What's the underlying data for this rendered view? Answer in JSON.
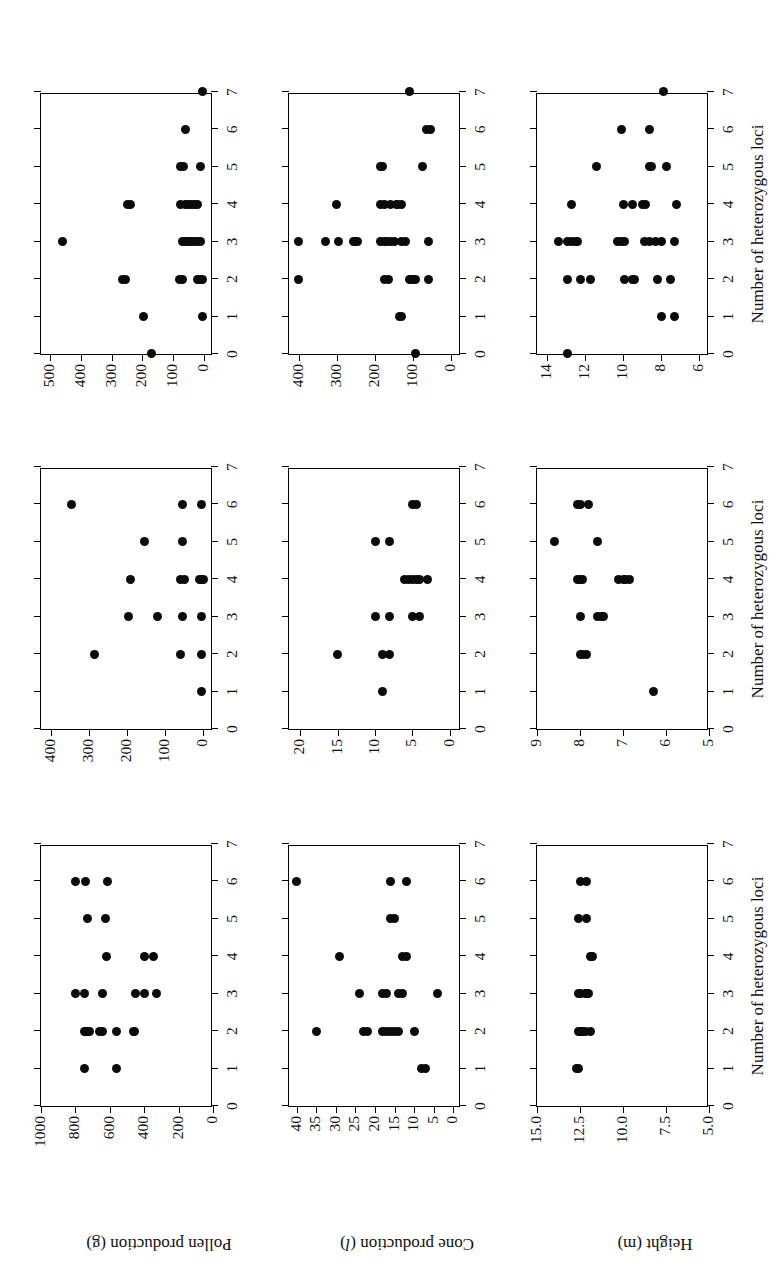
{
  "figure": {
    "x_axis_title": "Number of heterozygous loci",
    "x_ticks": [
      "0",
      "1",
      "2",
      "3",
      "4",
      "5",
      "6",
      "7"
    ],
    "dot_color": "#0b0b0b",
    "axis_color": "#000000"
  },
  "rows": [
    {
      "id": "pollen-production",
      "label": "Pollen production (g)",
      "label_main": "Pollen production (g)",
      "panels": [
        {
          "id": "pollen-panel-1",
          "y_ticks": [
            "0",
            "200",
            "400",
            "600",
            "800",
            "1000"
          ],
          "ylim": [
            0,
            1000
          ]
        },
        {
          "id": "pollen-panel-2",
          "y_ticks": [
            "0",
            "100",
            "200",
            "300",
            "400"
          ],
          "ylim": [
            -25,
            425
          ]
        },
        {
          "id": "pollen-panel-3",
          "y_ticks": [
            "0",
            "100",
            "200",
            "300",
            "400",
            "500"
          ],
          "ylim": [
            -30,
            530
          ]
        }
      ]
    },
    {
      "id": "cone-production",
      "label": "Cone production (l)",
      "label_main": "Cone production (",
      "label_italic": "l",
      "label_tail": ")",
      "panels": [
        {
          "id": "cone-panel-1",
          "y_ticks": [
            "0",
            "5",
            "10",
            "15",
            "20",
            "25",
            "30",
            "35",
            "40"
          ],
          "ylim": [
            -2,
            42
          ]
        },
        {
          "id": "cone-panel-2",
          "y_ticks": [
            "0",
            "5",
            "10",
            "15",
            "20"
          ],
          "ylim": [
            -1.5,
            21.5
          ]
        },
        {
          "id": "cone-panel-3",
          "y_ticks": [
            "0",
            "100",
            "200",
            "300",
            "400"
          ],
          "ylim": [
            -25,
            425
          ]
        }
      ]
    },
    {
      "id": "height",
      "label": "Height (m)",
      "label_main": "Height (m)",
      "panels": [
        {
          "id": "height-panel-1",
          "y_ticks": [
            "5.0",
            "7.5",
            "10.0",
            "12.5",
            "15.0"
          ],
          "ylim": [
            5.0,
            15.0
          ]
        },
        {
          "id": "height-panel-2",
          "y_ticks": [
            "5",
            "6",
            "7",
            "8",
            "9"
          ],
          "ylim": [
            5.0,
            9.0
          ]
        },
        {
          "id": "height-panel-3",
          "y_ticks": [
            "6",
            "8",
            "10",
            "12",
            "14"
          ],
          "ylim": [
            5.5,
            14.5
          ]
        }
      ]
    }
  ],
  "chart_data": [
    {
      "type": "scatter",
      "panel": "pollen-panel-1",
      "title": "",
      "xlabel": "Number of heterozygous loci",
      "ylabel": "Pollen production (g)",
      "xlim": [
        0,
        7
      ],
      "ylim": [
        0,
        1000
      ],
      "xticks": [
        0,
        1,
        2,
        3,
        4,
        5,
        6,
        7
      ],
      "yticks": [
        0,
        200,
        400,
        600,
        800,
        1000
      ],
      "grid": false,
      "points": [
        [
          1,
          745
        ],
        [
          1,
          560
        ],
        [
          2,
          745
        ],
        [
          2,
          740
        ],
        [
          2,
          735
        ],
        [
          2,
          730
        ],
        [
          2,
          720
        ],
        [
          2,
          660
        ],
        [
          2,
          640
        ],
        [
          2,
          560
        ],
        [
          2,
          460
        ],
        [
          2,
          455
        ],
        [
          3,
          800
        ],
        [
          3,
          745
        ],
        [
          3,
          640
        ],
        [
          3,
          450
        ],
        [
          3,
          400
        ],
        [
          3,
          330
        ],
        [
          4,
          620
        ],
        [
          4,
          400
        ],
        [
          4,
          345
        ],
        [
          5,
          730
        ],
        [
          5,
          625
        ],
        [
          6,
          800
        ],
        [
          6,
          740
        ],
        [
          6,
          615
        ]
      ]
    },
    {
      "type": "scatter",
      "panel": "pollen-panel-2",
      "title": "",
      "xlabel": "Number of heterozygous loci",
      "ylabel": "Pollen production (g)",
      "xlim": [
        0,
        7
      ],
      "ylim": [
        -25,
        425
      ],
      "xticks": [
        0,
        1,
        2,
        3,
        4,
        5,
        6,
        7
      ],
      "yticks": [
        0,
        100,
        200,
        300,
        400
      ],
      "grid": false,
      "points": [
        [
          1,
          5
        ],
        [
          2,
          285
        ],
        [
          2,
          60
        ],
        [
          2,
          5
        ],
        [
          3,
          195
        ],
        [
          3,
          120
        ],
        [
          3,
          55
        ],
        [
          3,
          5
        ],
        [
          4,
          190
        ],
        [
          4,
          60
        ],
        [
          4,
          50
        ],
        [
          4,
          10
        ],
        [
          4,
          5
        ],
        [
          4,
          0
        ],
        [
          5,
          155
        ],
        [
          5,
          55
        ],
        [
          6,
          345
        ],
        [
          6,
          55
        ],
        [
          6,
          5
        ]
      ]
    },
    {
      "type": "scatter",
      "panel": "pollen-panel-3",
      "title": "",
      "xlabel": "Number of heterozygous loci",
      "ylabel": "Pollen production (g)",
      "xlim": [
        0,
        7
      ],
      "ylim": [
        -30,
        530
      ],
      "xticks": [
        0,
        1,
        2,
        3,
        4,
        5,
        6,
        7
      ],
      "yticks": [
        0,
        100,
        200,
        300,
        400,
        500
      ],
      "grid": false,
      "points": [
        [
          0,
          170
        ],
        [
          1,
          195
        ],
        [
          1,
          5
        ],
        [
          2,
          265
        ],
        [
          2,
          255
        ],
        [
          2,
          80
        ],
        [
          2,
          70
        ],
        [
          2,
          20
        ],
        [
          2,
          10
        ],
        [
          2,
          5
        ],
        [
          3,
          460
        ],
        [
          3,
          70
        ],
        [
          3,
          60
        ],
        [
          3,
          50
        ],
        [
          3,
          45
        ],
        [
          3,
          40
        ],
        [
          3,
          30
        ],
        [
          3,
          20
        ],
        [
          3,
          10
        ],
        [
          4,
          250
        ],
        [
          4,
          240
        ],
        [
          4,
          75
        ],
        [
          4,
          60
        ],
        [
          4,
          50
        ],
        [
          4,
          40
        ],
        [
          4,
          30
        ],
        [
          4,
          20
        ],
        [
          5,
          75
        ],
        [
          5,
          65
        ],
        [
          5,
          10
        ],
        [
          6,
          60
        ],
        [
          7,
          5
        ]
      ]
    },
    {
      "type": "scatter",
      "panel": "cone-panel-1",
      "title": "",
      "xlabel": "Number of heterozygous loci",
      "ylabel": "Cone production (l)",
      "xlim": [
        0,
        7
      ],
      "ylim": [
        -2,
        42
      ],
      "xticks": [
        0,
        1,
        2,
        3,
        4,
        5,
        6,
        7
      ],
      "yticks": [
        0,
        5,
        10,
        15,
        20,
        25,
        30,
        35,
        40
      ],
      "grid": false,
      "points": [
        [
          1,
          8
        ],
        [
          1,
          7
        ],
        [
          2,
          35
        ],
        [
          2,
          23
        ],
        [
          2,
          22
        ],
        [
          2,
          18
        ],
        [
          2,
          17
        ],
        [
          2,
          16
        ],
        [
          2,
          15
        ],
        [
          2,
          14
        ],
        [
          2,
          10
        ],
        [
          3,
          24
        ],
        [
          3,
          18
        ],
        [
          3,
          17
        ],
        [
          3,
          14
        ],
        [
          3,
          13
        ],
        [
          3,
          4
        ],
        [
          4,
          29
        ],
        [
          4,
          13
        ],
        [
          4,
          12
        ],
        [
          5,
          16
        ],
        [
          5,
          15
        ],
        [
          6,
          40
        ],
        [
          6,
          16
        ],
        [
          6,
          12
        ]
      ]
    },
    {
      "type": "scatter",
      "panel": "cone-panel-2",
      "title": "",
      "xlabel": "Number of heterozygous loci",
      "ylabel": "Cone production (l)",
      "xlim": [
        0,
        7
      ],
      "ylim": [
        -1.5,
        21.5
      ],
      "xticks": [
        0,
        1,
        2,
        3,
        4,
        5,
        6,
        7
      ],
      "yticks": [
        0,
        5,
        10,
        15,
        20
      ],
      "grid": false,
      "points": [
        [
          1,
          9
        ],
        [
          2,
          15
        ],
        [
          2,
          9
        ],
        [
          2,
          8
        ],
        [
          3,
          10
        ],
        [
          3,
          8
        ],
        [
          3,
          5
        ],
        [
          3,
          4
        ],
        [
          4,
          6
        ],
        [
          4,
          5.5
        ],
        [
          4,
          5
        ],
        [
          4,
          4.5
        ],
        [
          4,
          4
        ],
        [
          4,
          3
        ],
        [
          5,
          10
        ],
        [
          5,
          8
        ],
        [
          6,
          5
        ],
        [
          6,
          4.5
        ]
      ]
    },
    {
      "type": "scatter",
      "panel": "cone-panel-3",
      "title": "",
      "xlabel": "Number of heterozygous loci",
      "ylabel": "Cone production (l)",
      "xlim": [
        0,
        7
      ],
      "ylim": [
        -25,
        425
      ],
      "xticks": [
        0,
        1,
        2,
        3,
        4,
        5,
        6,
        7
      ],
      "yticks": [
        0,
        100,
        200,
        300,
        400
      ],
      "grid": false,
      "points": [
        [
          0,
          95
        ],
        [
          1,
          135
        ],
        [
          1,
          130
        ],
        [
          2,
          400
        ],
        [
          2,
          175
        ],
        [
          2,
          165
        ],
        [
          2,
          110
        ],
        [
          2,
          105
        ],
        [
          2,
          100
        ],
        [
          2,
          95
        ],
        [
          2,
          60
        ],
        [
          3,
          400
        ],
        [
          3,
          330
        ],
        [
          3,
          295
        ],
        [
          3,
          255
        ],
        [
          3,
          250
        ],
        [
          3,
          245
        ],
        [
          3,
          185
        ],
        [
          3,
          175
        ],
        [
          3,
          170
        ],
        [
          3,
          160
        ],
        [
          3,
          150
        ],
        [
          3,
          130
        ],
        [
          3,
          120
        ],
        [
          3,
          60
        ],
        [
          4,
          300
        ],
        [
          4,
          185
        ],
        [
          4,
          175
        ],
        [
          4,
          160
        ],
        [
          4,
          145
        ],
        [
          4,
          140
        ],
        [
          4,
          130
        ],
        [
          5,
          185
        ],
        [
          5,
          180
        ],
        [
          5,
          75
        ],
        [
          6,
          65
        ],
        [
          6,
          55
        ],
        [
          7,
          110
        ]
      ]
    },
    {
      "type": "scatter",
      "panel": "height-panel-1",
      "title": "",
      "xlabel": "Number of heterozygous loci",
      "ylabel": "Height (m)",
      "xlim": [
        0,
        7
      ],
      "ylim": [
        5.0,
        15.0
      ],
      "xticks": [
        0,
        1,
        2,
        3,
        4,
        5,
        6,
        7
      ],
      "yticks": [
        5.0,
        7.5,
        10.0,
        12.5,
        15.0
      ],
      "grid": false,
      "points": [
        [
          1,
          12.7
        ],
        [
          1,
          12.6
        ],
        [
          2,
          12.6
        ],
        [
          2,
          12.55
        ],
        [
          2,
          12.5
        ],
        [
          2,
          12.45
        ],
        [
          2,
          12.4
        ],
        [
          2,
          12.3
        ],
        [
          2,
          12.2
        ],
        [
          2,
          11.9
        ],
        [
          3,
          12.6
        ],
        [
          3,
          12.5
        ],
        [
          3,
          12.2
        ],
        [
          3,
          12.15
        ],
        [
          3,
          12.1
        ],
        [
          3,
          12.0
        ],
        [
          4,
          11.9
        ],
        [
          4,
          11.85
        ],
        [
          4,
          11.8
        ],
        [
          5,
          12.6
        ],
        [
          5,
          12.1
        ],
        [
          6,
          12.5
        ],
        [
          6,
          12.1
        ]
      ]
    },
    {
      "type": "scatter",
      "panel": "height-panel-2",
      "title": "",
      "xlabel": "Number of heterozygous loci",
      "ylabel": "Height (m)",
      "xlim": [
        0,
        7
      ],
      "ylim": [
        5.0,
        9.0
      ],
      "xticks": [
        0,
        1,
        2,
        3,
        4,
        5,
        6,
        7
      ],
      "yticks": [
        5,
        6,
        7,
        8,
        9
      ],
      "grid": false,
      "points": [
        [
          1,
          6.3
        ],
        [
          2,
          8.0
        ],
        [
          2,
          7.95
        ],
        [
          2,
          7.85
        ],
        [
          3,
          8.0
        ],
        [
          3,
          7.6
        ],
        [
          3,
          7.5
        ],
        [
          3,
          7.45
        ],
        [
          4,
          8.05
        ],
        [
          4,
          8.0
        ],
        [
          4,
          7.95
        ],
        [
          4,
          7.1
        ],
        [
          4,
          7.0
        ],
        [
          4,
          6.95
        ],
        [
          4,
          6.85
        ],
        [
          5,
          8.6
        ],
        [
          5,
          7.6
        ],
        [
          6,
          8.05
        ],
        [
          6,
          8.0
        ],
        [
          6,
          7.8
        ]
      ]
    },
    {
      "type": "scatter",
      "panel": "height-panel-3",
      "title": "",
      "xlabel": "Number of heterozygous loci",
      "ylabel": "Height (m)",
      "xlim": [
        0,
        7
      ],
      "ylim": [
        5.5,
        14.5
      ],
      "xticks": [
        0,
        1,
        2,
        3,
        4,
        5,
        6,
        7
      ],
      "yticks": [
        6,
        8,
        10,
        12,
        14
      ],
      "grid": false,
      "points": [
        [
          0,
          12.9
        ],
        [
          1,
          8.0
        ],
        [
          1,
          7.3
        ],
        [
          2,
          12.9
        ],
        [
          2,
          12.2
        ],
        [
          2,
          11.7
        ],
        [
          2,
          9.9
        ],
        [
          2,
          9.5
        ],
        [
          2,
          9.4
        ],
        [
          2,
          8.2
        ],
        [
          2,
          7.5
        ],
        [
          3,
          13.4
        ],
        [
          3,
          12.9
        ],
        [
          3,
          12.7
        ],
        [
          3,
          12.5
        ],
        [
          3,
          12.4
        ],
        [
          3,
          10.3
        ],
        [
          3,
          10.1
        ],
        [
          3,
          9.9
        ],
        [
          3,
          8.9
        ],
        [
          3,
          8.6
        ],
        [
          3,
          8.3
        ],
        [
          3,
          8.0
        ],
        [
          3,
          7.3
        ],
        [
          4,
          12.7
        ],
        [
          4,
          10.0
        ],
        [
          4,
          9.5
        ],
        [
          4,
          9.0
        ],
        [
          4,
          8.8
        ],
        [
          4,
          7.2
        ],
        [
          5,
          11.4
        ],
        [
          5,
          8.6
        ],
        [
          5,
          8.5
        ],
        [
          5,
          7.7
        ],
        [
          6,
          10.1
        ],
        [
          6,
          8.6
        ],
        [
          7,
          7.9
        ]
      ]
    }
  ]
}
